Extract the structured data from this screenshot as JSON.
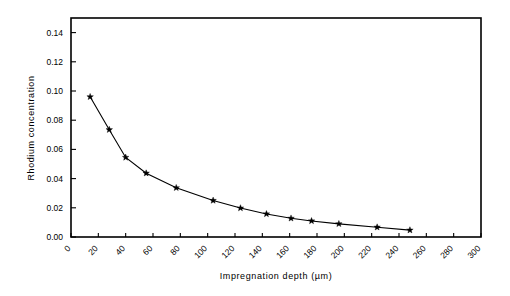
{
  "chart_data": {
    "type": "line",
    "title": "",
    "xlabel": "Impregnation depth (µm)",
    "ylabel": "Rhodium  concentration",
    "xlim": [
      0,
      300
    ],
    "ylim": [
      0.0,
      0.15
    ],
    "grid": false,
    "legend": null,
    "marker": "star",
    "line_color": "#000000",
    "marker_color": "#000000",
    "background_color": "#ffffff",
    "xticks": [
      0,
      20,
      40,
      60,
      80,
      100,
      120,
      140,
      160,
      180,
      200,
      220,
      240,
      260,
      280,
      300
    ],
    "xtick_labels": [
      "0",
      "20",
      "40",
      "60",
      "80",
      "100",
      "120",
      "140",
      "160",
      "180",
      "200",
      "220",
      "240",
      "260",
      "280",
      "300"
    ],
    "xtick_rotation": 45,
    "yticks": [
      0.0,
      0.02,
      0.04,
      0.06,
      0.08,
      0.1,
      0.12,
      0.14
    ],
    "ytick_labels": [
      "0.00",
      "0.02",
      "0.04",
      "0.06",
      "0.08",
      "0.10",
      "0.12",
      "0.14"
    ],
    "x": [
      14,
      28,
      40,
      55,
      77,
      104,
      124,
      143,
      161,
      176,
      196,
      224,
      248
    ],
    "y": [
      0.096,
      0.0735,
      0.0545,
      0.0437,
      0.0337,
      0.025,
      0.0198,
      0.0158,
      0.0128,
      0.011,
      0.009,
      0.0067,
      0.0047
    ],
    "series": [
      {
        "name": "Rhodium concentration profile",
        "points": [
          {
            "x": 14,
            "y": 0.096
          },
          {
            "x": 28,
            "y": 0.0735
          },
          {
            "x": 40,
            "y": 0.0545
          },
          {
            "x": 55,
            "y": 0.0437
          },
          {
            "x": 77,
            "y": 0.0337
          },
          {
            "x": 104,
            "y": 0.025
          },
          {
            "x": 124,
            "y": 0.0198
          },
          {
            "x": 143,
            "y": 0.0158
          },
          {
            "x": 161,
            "y": 0.0128
          },
          {
            "x": 176,
            "y": 0.011
          },
          {
            "x": 196,
            "y": 0.009
          },
          {
            "x": 224,
            "y": 0.0067
          },
          {
            "x": 248,
            "y": 0.0047
          }
        ]
      }
    ]
  }
}
